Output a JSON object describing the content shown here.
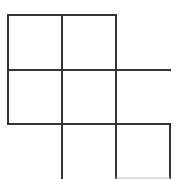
{
  "diagram": {
    "type": "grid-figure",
    "line_color": "#333333",
    "faint_line_color": "#bbbbbb",
    "background": "#ffffff",
    "grid": {
      "x_lines": [
        8,
        62,
        116,
        170
      ],
      "y_lines": [
        15,
        70,
        124,
        178
      ]
    },
    "segments": [
      {
        "id": "top-edge",
        "x1": 8,
        "y1": 15,
        "x2": 116,
        "y2": 15,
        "faint": false
      },
      {
        "id": "left-edge",
        "x1": 8,
        "y1": 15,
        "x2": 8,
        "y2": 124,
        "faint": false
      },
      {
        "id": "col2-left",
        "x1": 62,
        "y1": 15,
        "x2": 62,
        "y2": 179,
        "faint": false
      },
      {
        "id": "col3-left",
        "x1": 116,
        "y1": 15,
        "x2": 116,
        "y2": 179,
        "faint": false
      },
      {
        "id": "row2-top",
        "x1": 8,
        "y1": 70,
        "x2": 170,
        "y2": 70,
        "faint": false
      },
      {
        "id": "row3-top",
        "x1": 8,
        "y1": 124,
        "x2": 170,
        "y2": 124,
        "faint": false
      },
      {
        "id": "col3-right",
        "x1": 170,
        "y1": 124,
        "x2": 170,
        "y2": 179,
        "faint": false
      },
      {
        "id": "bottom-right-edge",
        "x1": 116,
        "y1": 178,
        "x2": 170,
        "y2": 178,
        "faint": true
      }
    ]
  }
}
